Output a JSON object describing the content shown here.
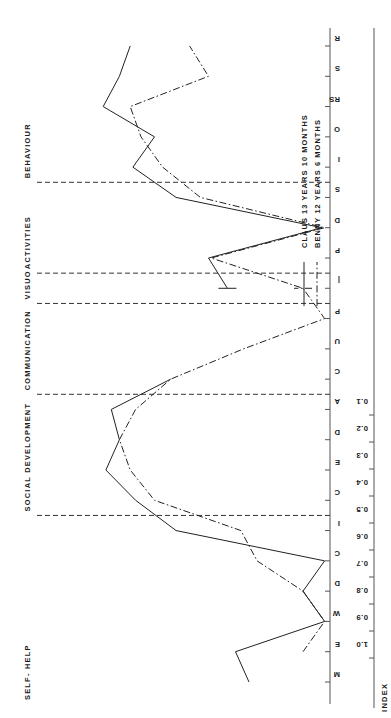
{
  "figure": {
    "index_axis_title": "INDEX",
    "caption": "Fig.1   Profiles of two children with cerebral palsy",
    "tick_labels": [
      "1.0",
      "0.9",
      "0.8",
      "0.7",
      "0.6",
      "0.5",
      "0.4",
      "0.3",
      "0.2",
      "0.1"
    ],
    "tick_values": [
      1.0,
      0.9,
      0.8,
      0.7,
      0.6,
      0.5,
      0.4,
      0.3,
      0.2,
      0.1
    ],
    "sections": [
      {
        "name": "SELF-HELP",
        "label": "SELF- HELP"
      },
      {
        "name": "SOCIAL DEVELOPMENT",
        "label": "SOCIAL DEVELOPMENT"
      },
      {
        "name": "COMMUNICATION",
        "label": "COMMUNICATION"
      },
      {
        "name": "VISUO",
        "label": "VISUO"
      },
      {
        "name": "ACTIVITIES",
        "label": "ACTIVITIES"
      },
      {
        "name": "BEHAVIOUR",
        "label": "BEHAVIOUR"
      }
    ],
    "legend": {
      "entries": [
        {
          "name": "CLAUS",
          "age": "13 YEARS  10 MONTHS",
          "label": "CLAUS    13 YEARS  10 MONTHS",
          "style": "solid"
        },
        {
          "name": "BENNY",
          "age": "12 YEARS  6 MONTHS",
          "label": "BENNY    12 YEARS  6 MONTHS",
          "style": "dash-dot"
        }
      ]
    }
  },
  "chart_data": {
    "type": "line",
    "title": "",
    "xlabel": "",
    "ylabel": "INDEX",
    "ylim": [
      0.0,
      1.05
    ],
    "grid": false,
    "legend_position": "top-right",
    "categories": [
      "M",
      "E",
      "W",
      "D",
      "C",
      "I",
      "C",
      "E",
      "D",
      "A",
      "C",
      "U",
      "P",
      "|",
      "P",
      "D",
      "S",
      "I",
      "O",
      "RS",
      "S",
      "R"
    ],
    "category_sections": [
      "SELF-HELP",
      "SELF-HELP",
      "SELF-HELP",
      "SELF-HELP",
      "SELF-HELP",
      "SELF-HELP",
      "SOCIAL DEVELOPMENT",
      "SOCIAL DEVELOPMENT",
      "SOCIAL DEVELOPMENT",
      "SOCIAL DEVELOPMENT",
      "COMMUNICATION",
      "COMMUNICATION",
      "COMMUNICATION",
      "VISUO",
      "ACTIVITIES",
      "ACTIVITIES",
      "ACTIVITIES",
      "BEHAVIOUR",
      "BEHAVIOUR",
      "BEHAVIOUR",
      "BEHAVIOUR",
      "BEHAVIOUR"
    ],
    "series": [
      {
        "name": "CLAUS",
        "style": "solid",
        "values": [
          0.3,
          0.35,
          0.02,
          0.1,
          0.02,
          0.57,
          0.72,
          0.83,
          0.78,
          0.81,
          0.59,
          null,
          null,
          0.38,
          0.45,
          0.03,
          0.57,
          0.73,
          0.65,
          0.84,
          0.78,
          0.74
        ]
      },
      {
        "name": "BENNY",
        "style": "dash-dot",
        "values": [
          null,
          0.1,
          0.02,
          0.1,
          0.27,
          0.33,
          0.65,
          0.74,
          0.78,
          0.72,
          0.59,
          0.32,
          0.02,
          0.1,
          0.44,
          0.02,
          0.48,
          0.62,
          0.7,
          0.74,
          0.45,
          0.52
        ]
      }
    ]
  }
}
